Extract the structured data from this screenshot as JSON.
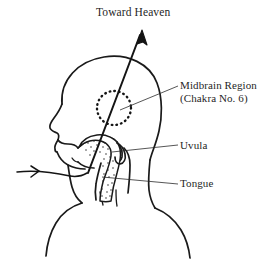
{
  "figure": {
    "title": "Toward Heaven",
    "background_color": "#ffffff",
    "ink_color": "#1a1a1a"
  },
  "annotations": {
    "midbrain": {
      "line1": "Midbrain Region",
      "line2": "(Chakra No. 6)"
    },
    "uvula": "Uvula",
    "tongue": "Tongue"
  }
}
